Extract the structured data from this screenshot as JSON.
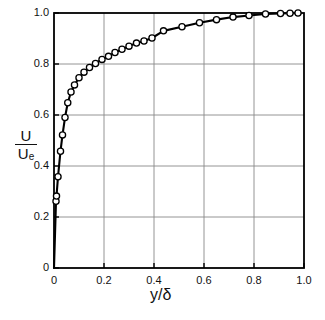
{
  "chart_data": {
    "type": "line",
    "title": "",
    "xlabel": "y/δ",
    "ylabel": "U/Uₑ",
    "ylabel_numerator": "U",
    "ylabel_denominator": "U",
    "ylabel_denominator_subscript": "e",
    "xlabel_numerator": "y",
    "xlabel_denominator": "δ",
    "xlim": [
      0,
      1.0
    ],
    "ylim": [
      0,
      1.0
    ],
    "xticks": [
      0,
      0.2,
      0.4,
      0.6,
      0.8,
      1.0
    ],
    "xtick_labels": [
      "0",
      "0.2",
      "0.4",
      "0.6",
      "0.8",
      "1.0"
    ],
    "yticks": [
      0,
      0.2,
      0.4,
      0.6,
      0.8,
      1.0
    ],
    "ytick_labels": [
      "0",
      "0.2",
      "0.4",
      "0.6",
      "0.8",
      "1.0"
    ],
    "grid": true,
    "grid_color": "#888888",
    "line_color": "#000000",
    "marker": "open-circle",
    "marker_face_color": "#ffffff",
    "marker_edge_color": "#000000",
    "legend": null,
    "series": [
      {
        "name": "velocity-profile",
        "x": [
          0.0,
          0.008,
          0.01,
          0.016,
          0.026,
          0.034,
          0.044,
          0.055,
          0.068,
          0.082,
          0.1,
          0.12,
          0.142,
          0.166,
          0.192,
          0.218,
          0.244,
          0.272,
          0.3,
          0.33,
          0.36,
          0.392,
          0.438,
          0.512,
          0.582,
          0.65,
          0.716,
          0.78,
          0.846,
          0.906,
          0.944,
          0.976
        ],
        "y": [
          0.0,
          0.262,
          0.282,
          0.358,
          0.458,
          0.522,
          0.59,
          0.648,
          0.69,
          0.718,
          0.746,
          0.768,
          0.786,
          0.802,
          0.818,
          0.83,
          0.845,
          0.858,
          0.87,
          0.882,
          0.89,
          0.902,
          0.93,
          0.946,
          0.962,
          0.974,
          0.984,
          0.99,
          0.996,
          0.998,
          0.999,
          1.0
        ]
      }
    ]
  },
  "axes": {
    "x_tick_positions_px": [
      54,
      104,
      154,
      204,
      254,
      304
    ],
    "y_tick_positions_px": [
      268,
      217,
      166,
      115,
      64,
      13
    ],
    "plot_left_px": 54,
    "plot_right_px": 304,
    "plot_top_px": 13,
    "plot_bottom_px": 268
  }
}
